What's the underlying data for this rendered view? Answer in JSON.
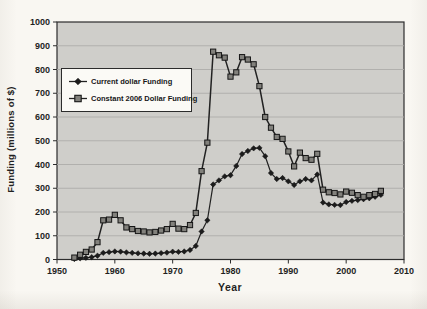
{
  "figure": {
    "background_color": "#f9f7f2",
    "plot_background_color": "#cfceca",
    "gridline_color": "#aeada9",
    "axis_color": "#2c2c2c",
    "tick_label_color": "#1f1f1f",
    "series_line_color": "#222222",
    "square_marker_fill": "#82817c",
    "diamond_marker_fill": "#1c1c1c"
  },
  "chart_data": {
    "type": "line",
    "title": "",
    "xlabel": "Year",
    "ylabel": "Funding (millions of $)",
    "xlim": [
      1950,
      2010
    ],
    "ylim": [
      0,
      1000
    ],
    "x_ticks": [
      1950,
      1960,
      1970,
      1980,
      1990,
      2000,
      2010
    ],
    "y_ticks": [
      0,
      100,
      200,
      300,
      400,
      500,
      600,
      700,
      800,
      900,
      1000
    ],
    "grid": "horizontal",
    "legend_position": "upper-left-inside",
    "x": [
      1953,
      1954,
      1955,
      1956,
      1957,
      1958,
      1959,
      1960,
      1961,
      1962,
      1963,
      1964,
      1965,
      1966,
      1967,
      1968,
      1969,
      1970,
      1971,
      1972,
      1973,
      1974,
      1975,
      1976,
      1977,
      1978,
      1979,
      1980,
      1981,
      1982,
      1983,
      1984,
      1985,
      1986,
      1987,
      1988,
      1989,
      1990,
      1991,
      1992,
      1993,
      1994,
      1995,
      1996,
      1997,
      1998,
      1999,
      2000,
      2001,
      2002,
      2003,
      2004,
      2005,
      2006
    ],
    "series": [
      {
        "name": "Current dollar Funding",
        "marker": "diamond",
        "values": [
          2,
          5,
          7,
          10,
          16,
          28,
          31,
          34,
          33,
          30,
          28,
          26,
          25,
          24,
          25,
          27,
          29,
          33,
          32,
          34,
          40,
          57,
          118,
          165,
          316,
          333,
          350,
          355,
          394,
          444,
          457,
          468,
          470,
          435,
          364,
          339,
          343,
          329,
          314,
          329,
          339,
          333,
          358,
          240,
          232,
          230,
          229,
          242,
          247,
          250,
          254,
          258,
          264,
          272
        ]
      },
      {
        "name": "Constant 2006 Dollar Funding",
        "marker": "square",
        "values": [
          8,
          20,
          32,
          42,
          73,
          165,
          168,
          188,
          165,
          135,
          128,
          120,
          118,
          114,
          116,
          122,
          128,
          150,
          130,
          128,
          145,
          196,
          372,
          492,
          875,
          860,
          850,
          770,
          788,
          852,
          842,
          822,
          730,
          600,
          555,
          516,
          508,
          455,
          392,
          450,
          427,
          420,
          445,
          294,
          283,
          280,
          274,
          286,
          281,
          271,
          264,
          271,
          276,
          289
        ]
      }
    ]
  }
}
